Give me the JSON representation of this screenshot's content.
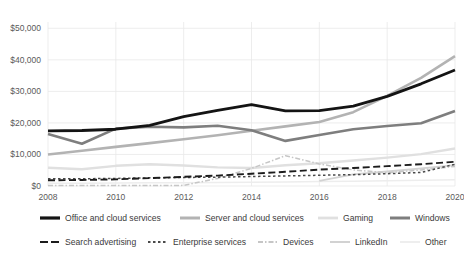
{
  "chart_data": {
    "type": "line",
    "title": "",
    "xlabel": "",
    "ylabel": "",
    "x": [
      2008,
      2009,
      2010,
      2011,
      2012,
      2013,
      2014,
      2015,
      2016,
      2017,
      2018,
      2019,
      2020
    ],
    "xtick_labels": [
      "2008",
      "2010",
      "2012",
      "2014",
      "2016",
      "2018",
      "2020"
    ],
    "xticks": [
      2008,
      2010,
      2012,
      2014,
      2016,
      2018,
      2020
    ],
    "ytick_labels": [
      "$0",
      "$10,000",
      "$20,000",
      "$30,000",
      "$40,000",
      "$50,000"
    ],
    "yticks": [
      0,
      10000,
      20000,
      30000,
      40000,
      50000
    ],
    "ylim": [
      0,
      52000
    ],
    "xlim": [
      2008,
      2020
    ],
    "grid": true,
    "legend_position": "bottom",
    "series": [
      {
        "name": "Office and cloud services",
        "color": "#141414",
        "width": 2.8,
        "dash": "none",
        "values": [
          17500,
          17600,
          18000,
          19200,
          22000,
          24000,
          25800,
          23800,
          23900,
          25300,
          28400,
          32400,
          36800
        ]
      },
      {
        "name": "Server and cloud services",
        "color": "#b3b3b3",
        "width": 2.6,
        "dash": "none",
        "values": [
          10000,
          11200,
          12400,
          13600,
          14800,
          16100,
          17500,
          18900,
          20300,
          23400,
          28600,
          34300,
          41200
        ]
      },
      {
        "name": "Gaming",
        "color": "#e0e0e0",
        "width": 2.4,
        "dash": "none",
        "values": [
          5800,
          5300,
          6400,
          6900,
          6500,
          5900,
          5700,
          6600,
          7200,
          8100,
          9000,
          10100,
          11900
        ]
      },
      {
        "name": "Windows",
        "color": "#7e7e7e",
        "width": 2.6,
        "dash": "none",
        "values": [
          16500,
          13400,
          18200,
          18800,
          18600,
          19100,
          17700,
          14300,
          16200,
          18000,
          19000,
          19900,
          23800
        ]
      },
      {
        "name": "Search advertising",
        "color": "#1c1c1c",
        "width": 1.9,
        "dash": "7 3.5",
        "values": [
          1800,
          1900,
          2100,
          2500,
          2900,
          3300,
          3900,
          4500,
          5200,
          5700,
          6300,
          6900,
          7700
        ]
      },
      {
        "name": "Enterprise services",
        "color": "#4a4a4a",
        "width": 1.5,
        "dash": "2.5 2.5",
        "values": [
          2300,
          2300,
          2400,
          2600,
          2700,
          2800,
          3000,
          3200,
          3400,
          3600,
          3900,
          4300,
          6900
        ]
      },
      {
        "name": "Devices",
        "color": "#c6c6c6",
        "width": 1.5,
        "dash": "5 2 1.5 2",
        "values": [
          150,
          150,
          160,
          170,
          200,
          2400,
          5600,
          9600,
          7000,
          5100,
          4200,
          5100,
          6200
        ]
      },
      {
        "name": "LinkedIn",
        "color": "#d2d2d2",
        "width": 1.8,
        "dash": "none",
        "values": [
          0,
          0,
          0,
          0,
          0,
          0,
          0,
          0,
          1600,
          3700,
          4600,
          5600,
          6600
        ]
      },
      {
        "name": "Other",
        "color": "#ededed",
        "width": 1.5,
        "dash": "none",
        "values": [
          900,
          900,
          950,
          1000,
          1050,
          1100,
          1200,
          1300,
          1400,
          1500,
          1650,
          1800,
          2000
        ]
      }
    ],
    "legend_rows": [
      [
        {
          "label": "Office and cloud services",
          "color": "#141414",
          "width": 3.2,
          "dash": "none"
        },
        {
          "label": "Server and cloud services",
          "color": "#b3b3b3",
          "width": 3.0,
          "dash": "none"
        },
        {
          "label": "Gaming",
          "color": "#e0e0e0",
          "width": 2.8,
          "dash": "none"
        },
        {
          "label": "Windows",
          "color": "#7e7e7e",
          "width": 3.0,
          "dash": "none"
        }
      ],
      [
        {
          "label": "Search advertising",
          "color": "#1c1c1c",
          "width": 2.0,
          "dash": "8 3"
        },
        {
          "label": "Enterprise services",
          "color": "#4a4a4a",
          "width": 1.8,
          "dash": "2.5 2.5"
        },
        {
          "label": "Devices",
          "color": "#c6c6c6",
          "width": 1.8,
          "dash": "5 2 1.5 2"
        },
        {
          "label": "LinkedIn",
          "color": "#d2d2d2",
          "width": 2.0,
          "dash": "none"
        },
        {
          "label": "Other",
          "color": "#ededed",
          "width": 1.8,
          "dash": "none"
        }
      ]
    ]
  }
}
